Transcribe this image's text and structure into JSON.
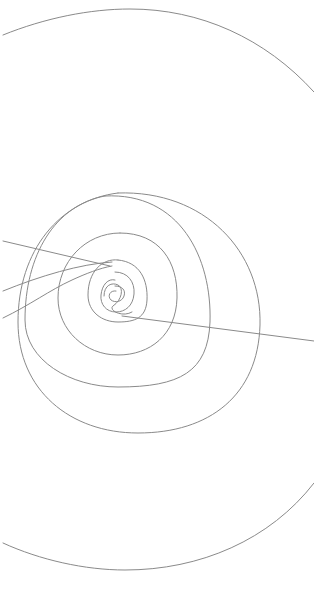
{
  "drawing": {
    "title": "",
    "subject": "spiral-line-drawing",
    "background": "#ffffff",
    "stroke_color": "#8a8a8a",
    "stroke_width": 1,
    "paths": [
      {
        "name": "outer-arc-top",
        "d": "M3,35 C45,18 90,9 130,9 C200,9 265,38 314,92"
      },
      {
        "name": "outer-arc-bottom",
        "d": "M3,543 C40,560 85,570 125,570 C200,570 270,540 314,483"
      },
      {
        "name": "spiral-ring-5",
        "d": "M118,193 C205,190 262,252 260,325 C258,395 210,433 138,433 C70,433 18,390 18,322 C18,250 60,200 118,193"
      },
      {
        "name": "spiral-ring-4",
        "d": "M105,196 C180,192 212,258 210,322 C208,372 180,387 118,387 C70,387 25,360 25,320 C25,255 55,205 105,196"
      },
      {
        "name": "spiral-ring-3",
        "d": "M120,233 C160,233 178,262 177,298 C176,335 150,355 118,355 C85,355 58,330 58,298 C58,262 85,233 120,233"
      },
      {
        "name": "spiral-ring-2",
        "d": "M118,260 C140,262 148,280 147,300 C146,318 135,322 118,322 C102,322 88,312 88,295 C88,272 102,258 118,260"
      },
      {
        "name": "spiral-ring-1",
        "d": "M115,272 C128,272 135,282 134,294 C133,306 125,312 116,312 C106,312 100,304 101,295 C102,285 108,278 115,280"
      },
      {
        "name": "spiral-core",
        "d": "M115,286 C122,286 126,290 124,296 C122,302 115,303 111,300 C107,296 110,290 116,291"
      },
      {
        "name": "core-swirl",
        "d": "M104,296 C104,285 112,282 118,285 C124,288 122,300 113,306 C108,310 122,318 132,312"
      },
      {
        "name": "tangent-line-right",
        "d": "M122,316 L314,341"
      },
      {
        "name": "tangent-line-upper-left",
        "d": "M3,241 L110,266"
      },
      {
        "name": "tangent-line-mid-left",
        "d": "M3,291 C40,276 80,264 112,262"
      },
      {
        "name": "tangent-line-lower-left",
        "d": "M3,318 C30,305 50,290 72,280 C85,274 100,268 112,266"
      }
    ]
  }
}
